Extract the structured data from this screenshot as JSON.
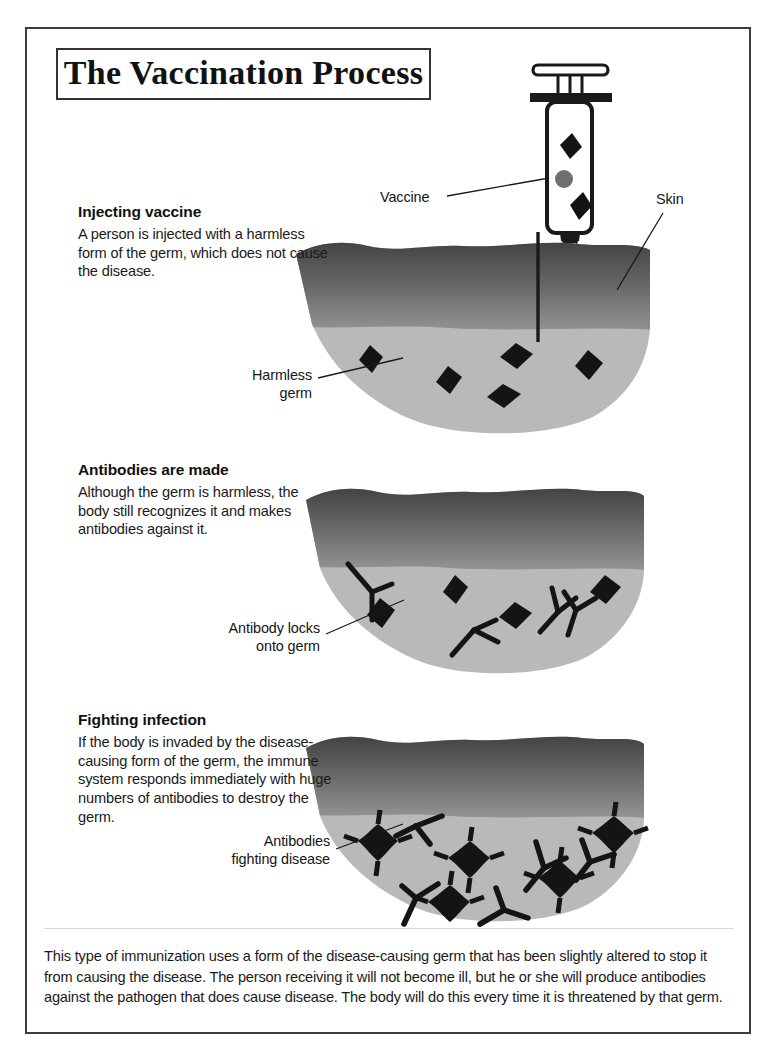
{
  "document": {
    "title": "The Vaccination Process"
  },
  "steps": [
    {
      "id": "injecting-vaccine",
      "heading": "Injecting vaccine",
      "body": "A person is injected with a harmless form of the germ, which does not cause the disease."
    },
    {
      "id": "antibodies-are-made",
      "heading": "Antibodies are made",
      "body": "Although the germ is harmless, the body still recognizes it and makes antibodies against it."
    },
    {
      "id": "fighting-infection",
      "heading": "Fighting infection",
      "body": "If the body is invaded by the disease-causing form of the germ, the immune system responds immediately with huge numbers of antibodies to destroy the germ."
    }
  ],
  "callouts": {
    "vaccine": "Vaccine",
    "skin": "Skin",
    "harmless_germ": "Harmless\ngerm",
    "antibody_locks": "Antibody locks\nonto germ",
    "antibodies_fighting": "Antibodies\nfighting disease"
  },
  "caption": {
    "text": "This type of immunization uses a form of the disease-causing germ that has been slightly altered to stop it from causing the disease. The person receiving it will not become ill, but he or she will produce antibodies against the pathogen that does cause disease. The body will do this every time it is threatened by that germ."
  },
  "colors": {
    "ink": "#1a1a1a",
    "frame_border": "#3d3d3d",
    "skin_dark": "#3f3f3f",
    "skin_mid": "#8d8d8d",
    "tissue_light": "#b9b9b9",
    "germ_black": "#141414",
    "vaccine_dot_gray": "#6f6f6f",
    "divider": "#d8d8d8"
  },
  "illustration": {
    "syringe": {
      "name": "syringe",
      "parts": [
        "plunger-top",
        "plunger-rod",
        "barrel-flange",
        "barrel",
        "vaccine-dot",
        "germ-diamonds",
        "needle-hub",
        "needle"
      ],
      "germ_count": 2,
      "vaccine_dot_count": 1
    },
    "panel_1": {
      "name": "tissue-cross-section-injection",
      "germ_count": 5,
      "germ_type": "harmless-diamond",
      "antibody_count": 0,
      "needle_inserted": true
    },
    "panel_2": {
      "name": "tissue-cross-section-antibodies",
      "germ_count": 4,
      "germ_type": "harmless-diamond",
      "antibody_count": 4
    },
    "panel_3": {
      "name": "tissue-cross-section-fighting",
      "germ_count": 6,
      "germ_type": "spiky-disease-germ",
      "antibody_count": 6
    }
  }
}
